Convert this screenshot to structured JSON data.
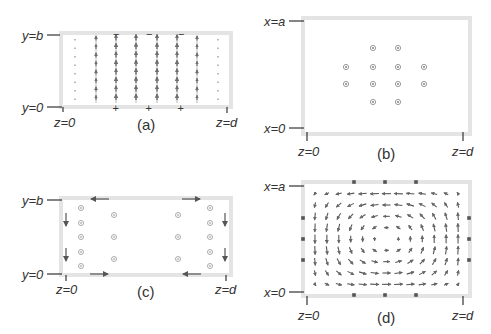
{
  "figure": {
    "panels": [
      {
        "id": "a",
        "caption": "(a)",
        "labels": {
          "top_left": "y=b",
          "bottom_left": "y=0",
          "bottom_start": "z=0",
          "bottom_end": "z=d"
        },
        "description": "Vertical field lines pointing upward; charges minus on top, plus on bottom",
        "top_charges": [
          "−",
          "−",
          "−"
        ],
        "bottom_charges": [
          "+",
          "+",
          "+"
        ]
      },
      {
        "id": "b",
        "caption": "(b)",
        "labels": {
          "top_left": "x=a",
          "bottom_left": "x=0",
          "bottom_start": "z=0",
          "bottom_end": "z=d"
        },
        "description": "Grid of dot symbols (field into/out of page)"
      },
      {
        "id": "c",
        "caption": "(c)",
        "labels": {
          "top_left": "y=b",
          "bottom_left": "y=0",
          "bottom_start": "z=0",
          "bottom_end": "z=d"
        },
        "description": "Surface current arrows on boundary and dot symbols in columns"
      },
      {
        "id": "d",
        "caption": "(d)",
        "labels": {
          "top_left": "x=a",
          "bottom_left": "x=0",
          "bottom_start": "z=0",
          "bottom_end": "z=d"
        },
        "description": "Circulating vortex field of arrows with square markers on boundary"
      }
    ],
    "colors": {
      "frame": "#e4e4e4",
      "ink": "#555555",
      "dot": "#9a9a9a"
    }
  }
}
